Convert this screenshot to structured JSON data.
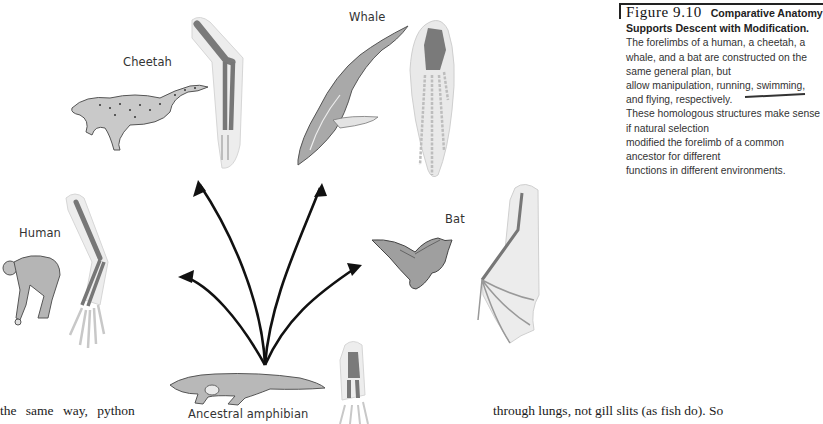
{
  "figure": {
    "number": "Figure 9.10",
    "title": "Comparative Anatomy Supports Descent with Modification.",
    "caption_lines": [
      "The forelimbs of a human, a cheetah, a",
      "whale, and a bat are constructed on the same general plan, but",
      "allow manipulation, running, swimming, and flying, respectively.",
      "These homologous structures make sense if natural selection",
      "modified the forelimb of a common ancestor for different",
      "functions in different environments."
    ]
  },
  "labels": {
    "cheetah": "Cheetah",
    "whale": "Whale",
    "human": "Human",
    "bat": "Bat",
    "ancestor": "Ancestral amphibian"
  },
  "body_text": {
    "left_fragment": "the   same   way,   python",
    "right_fragment": "through lungs, not gill slits (as fish do). So"
  },
  "colors": {
    "bone": "#6e6e6e",
    "limb_outline": "#d9d9d9",
    "arrow": "#111111",
    "text": "#333333"
  }
}
